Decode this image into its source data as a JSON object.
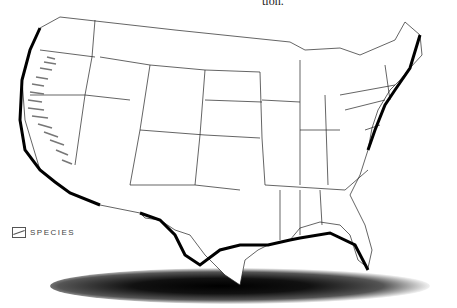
{
  "header": {
    "fragment_text": "tion."
  },
  "map": {
    "title": "United States",
    "style": {
      "land": "#ffffff",
      "border": "#222222",
      "coast": "#000000",
      "shadow": "#000000",
      "hatch": "#777777"
    }
  },
  "legend": {
    "label": "SPECIES",
    "icon": "hatch-swatch-icon"
  }
}
